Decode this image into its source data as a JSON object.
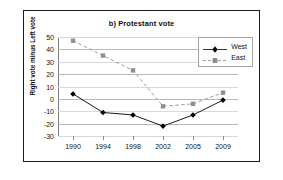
{
  "chart_data": {
    "type": "line",
    "title": "b) Protestant vote",
    "xlabel": "",
    "ylabel": "Right vote minus Left vote",
    "categories": [
      "1990",
      "1994",
      "1998",
      "2002",
      "2005",
      "2009"
    ],
    "ylim": [
      -30,
      50
    ],
    "ytick_values": [
      50,
      40,
      30,
      20,
      10,
      0,
      -10,
      -20,
      -30
    ],
    "ytick_labels": [
      "50",
      "40",
      "30",
      "20",
      "10",
      "0",
      "-10",
      "-20",
      "-30"
    ],
    "grid": true,
    "legend_position": "top-right",
    "series": [
      {
        "name": "West",
        "line_style": "solid",
        "marker": "diamond",
        "color": "#000000",
        "values": [
          4,
          -11,
          -13,
          -22,
          -13,
          -1
        ]
      },
      {
        "name": "East",
        "line_style": "dashed",
        "marker": "square",
        "color": "#909090",
        "values": [
          47,
          35,
          23,
          -6,
          -4,
          5
        ]
      }
    ]
  },
  "legend": {
    "entries": [
      {
        "label": "West"
      },
      {
        "label": "East"
      }
    ]
  }
}
